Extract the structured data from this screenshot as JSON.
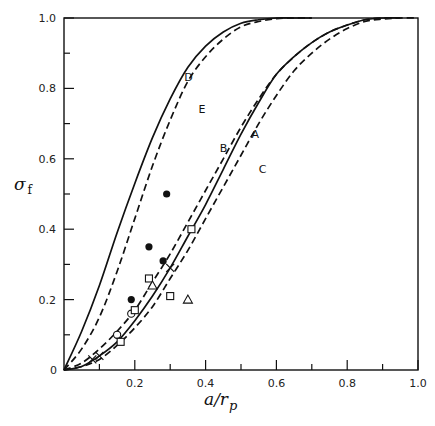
{
  "chart_data": {
    "type": "line",
    "title": "",
    "xlabel": "a/r_p",
    "ylabel": "σ_f",
    "xlim": [
      0,
      1.0
    ],
    "ylim": [
      0,
      1.0
    ],
    "grid": false,
    "legend": "none (curves labeled inline A–E)",
    "x_ticks": [
      "0.2",
      "0.4",
      "0.6",
      "0.8",
      "1.0"
    ],
    "x_minor_ticks": [
      0.1,
      0.3,
      0.5,
      0.7,
      0.9
    ],
    "y_ticks": [
      "0",
      "0.2",
      "0.4",
      "0.6",
      "0.8",
      "1.0"
    ],
    "y_minor_ticks": [
      0.1,
      0.3,
      0.5,
      0.7,
      0.9
    ],
    "series": [
      {
        "name": "D",
        "style": "solid",
        "x": [
          0,
          0.05,
          0.1,
          0.15,
          0.2,
          0.25,
          0.3,
          0.35,
          0.4,
          0.45,
          0.5,
          0.55,
          0.6,
          0.65,
          0.7
        ],
        "y": [
          0,
          0.11,
          0.24,
          0.39,
          0.53,
          0.66,
          0.77,
          0.86,
          0.92,
          0.96,
          0.985,
          0.995,
          1.0,
          1.0,
          1.0
        ]
      },
      {
        "name": "E",
        "style": "dashed",
        "x": [
          0,
          0.05,
          0.1,
          0.15,
          0.2,
          0.25,
          0.3,
          0.35,
          0.4,
          0.45,
          0.5,
          0.55,
          0.6,
          0.65,
          0.7
        ],
        "y": [
          0,
          0.06,
          0.15,
          0.28,
          0.43,
          0.58,
          0.71,
          0.82,
          0.89,
          0.94,
          0.975,
          0.99,
          0.998,
          1.0,
          1.0
        ]
      },
      {
        "name": "B",
        "style": "dashed",
        "x": [
          0,
          0.05,
          0.1,
          0.15,
          0.2,
          0.25,
          0.3,
          0.35,
          0.4,
          0.45,
          0.5,
          0.55,
          0.6,
          0.65,
          0.7,
          0.75,
          0.8,
          0.85,
          0.9,
          0.95
        ],
        "y": [
          0,
          0.02,
          0.06,
          0.11,
          0.17,
          0.25,
          0.33,
          0.42,
          0.51,
          0.6,
          0.69,
          0.77,
          0.84,
          0.89,
          0.93,
          0.96,
          0.98,
          0.995,
          1.0,
          1.0
        ]
      },
      {
        "name": "A",
        "style": "solid",
        "x": [
          0,
          0.05,
          0.1,
          0.15,
          0.2,
          0.25,
          0.3,
          0.35,
          0.4,
          0.45,
          0.5,
          0.55,
          0.6,
          0.65,
          0.7,
          0.75,
          0.8,
          0.85,
          0.9,
          0.95
        ],
        "y": [
          0,
          0.01,
          0.04,
          0.08,
          0.14,
          0.21,
          0.29,
          0.38,
          0.47,
          0.57,
          0.67,
          0.76,
          0.84,
          0.89,
          0.93,
          0.96,
          0.98,
          0.995,
          1.0,
          1.0
        ]
      },
      {
        "name": "C",
        "style": "dashed",
        "x": [
          0,
          0.05,
          0.1,
          0.15,
          0.2,
          0.25,
          0.3,
          0.35,
          0.4,
          0.45,
          0.5,
          0.55,
          0.6,
          0.65,
          0.7,
          0.75,
          0.8,
          0.85,
          0.9,
          0.95,
          1.0
        ],
        "y": [
          0,
          0.01,
          0.03,
          0.07,
          0.12,
          0.18,
          0.26,
          0.34,
          0.43,
          0.52,
          0.61,
          0.7,
          0.78,
          0.85,
          0.9,
          0.94,
          0.97,
          0.99,
          0.997,
          1.0,
          1.0
        ]
      }
    ],
    "curve_labels": [
      {
        "text": "D",
        "x": 0.34,
        "y": 0.82
      },
      {
        "text": "E",
        "x": 0.38,
        "y": 0.73
      },
      {
        "text": "B",
        "x": 0.44,
        "y": 0.62
      },
      {
        "text": "A",
        "x": 0.53,
        "y": 0.66
      },
      {
        "text": "C",
        "x": 0.55,
        "y": 0.56
      }
    ],
    "markers": [
      {
        "type": "filled-circle",
        "points": [
          [
            0.19,
            0.2
          ],
          [
            0.24,
            0.35
          ],
          [
            0.29,
            0.5
          ],
          [
            0.28,
            0.31
          ]
        ]
      },
      {
        "type": "open-circle",
        "points": [
          [
            0.15,
            0.1
          ],
          [
            0.19,
            0.16
          ]
        ]
      },
      {
        "type": "open-square",
        "points": [
          [
            0.16,
            0.08
          ],
          [
            0.2,
            0.17
          ],
          [
            0.24,
            0.26
          ],
          [
            0.3,
            0.21
          ],
          [
            0.36,
            0.4
          ]
        ]
      },
      {
        "type": "open-triangle",
        "points": [
          [
            0.25,
            0.24
          ],
          [
            0.35,
            0.2
          ]
        ]
      },
      {
        "type": "cross",
        "points": [
          [
            0.08,
            0.03
          ],
          [
            0.1,
            0.04
          ],
          [
            0.3,
            0.29
          ]
        ]
      }
    ]
  },
  "axes": {
    "x_title_main": "a/r",
    "x_title_sub": "p",
    "y_title_main": "σ",
    "y_title_sub": "f",
    "origin_label": "0"
  }
}
